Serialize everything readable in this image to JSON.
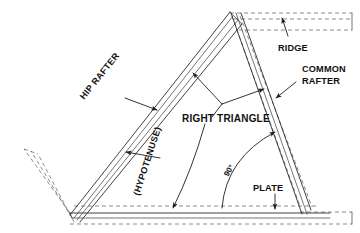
{
  "diagram": {
    "background_color": "#ffffff",
    "line_color": "#2b2b2b",
    "dashed_color": "#5a5a5a",
    "text_color": "#111111",
    "labels": {
      "ridge": "RIDGE",
      "common_rafter_line1": "COMMON",
      "common_rafter_line2": "RAFTER",
      "hip_rafter": "HIP RAFTER",
      "hypotenuse": "(HYPOTENUSE)",
      "right_triangle": "RIGHT TRIANGLE",
      "angle_90": "90°",
      "plate": "PLATE"
    }
  }
}
